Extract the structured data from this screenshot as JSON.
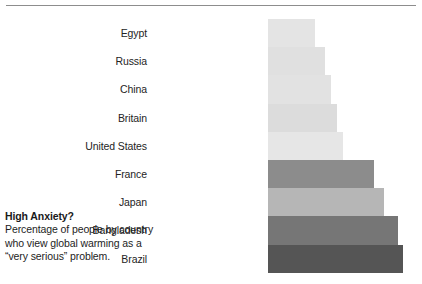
{
  "caption": {
    "title": "High Anxiety?",
    "lines": [
      "Percentage of people by country",
      "who view global warming as a",
      "“very serious” problem."
    ]
  },
  "colors": {
    "rule": "#8d8d8d",
    "label_text": "#242424",
    "caption_text": "#1d1d1d",
    "background": "#ffffff"
  },
  "chart_data": {
    "type": "bar",
    "orientation": "horizontal",
    "title": "High Anxiety?",
    "subtitle": "Percentage of people by country who view global warming as a “very serious” problem.",
    "xlabel": "",
    "ylabel": "",
    "grid": false,
    "legend": "none",
    "axis_visible": false,
    "value_labels_shown": false,
    "xlim": [
      0,
      100
    ],
    "categories": [
      "Egypt",
      "Russia",
      "China",
      "Britain",
      "United States",
      "France",
      "Japan",
      "Bangladesh",
      "Brazil"
    ],
    "values": [
      35,
      42,
      47,
      52,
      56,
      79,
      86,
      96,
      100
    ],
    "bars": [
      {
        "label": "Egypt",
        "value": 35,
        "width_px": 47,
        "color": "#e4e4e4"
      },
      {
        "label": "Russia",
        "value": 42,
        "width_px": 57,
        "color": "#e0e0e0"
      },
      {
        "label": "China",
        "value": 47,
        "width_px": 63,
        "color": "#e2e2e2"
      },
      {
        "label": "Britain",
        "value": 52,
        "width_px": 69,
        "color": "#dcdcdc"
      },
      {
        "label": "United States",
        "value": 56,
        "width_px": 75,
        "color": "#e6e6e6"
      },
      {
        "label": "France",
        "value": 79,
        "width_px": 106,
        "color": "#8c8c8c"
      },
      {
        "label": "Japan",
        "value": 86,
        "width_px": 116,
        "color": "#b6b6b6"
      },
      {
        "label": "Bangladesh",
        "value": 96,
        "width_px": 130,
        "color": "#767676"
      },
      {
        "label": "Brazil",
        "value": 100,
        "width_px": 135,
        "color": "#555555"
      }
    ]
  }
}
